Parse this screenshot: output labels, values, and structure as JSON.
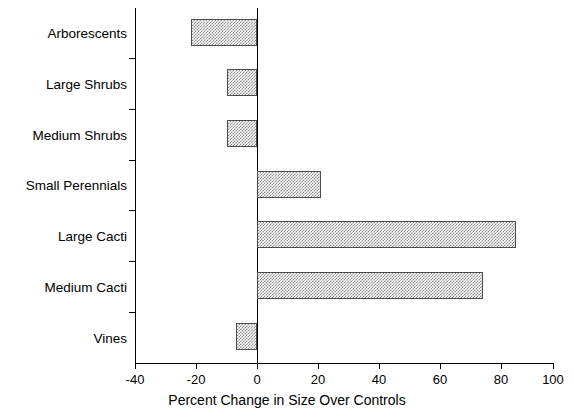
{
  "chart_data": {
    "type": "bar",
    "orientation": "horizontal",
    "title": "",
    "xlabel": "Percent Change in Size Over Controls",
    "ylabel": "",
    "xlim": [
      -40,
      100
    ],
    "xticks": [
      -40,
      -20,
      0,
      20,
      40,
      60,
      80,
      100
    ],
    "xtick_labels": [
      "-40",
      "-20",
      "0",
      "20",
      "40",
      "60",
      "80",
      "100"
    ],
    "grid": false,
    "legend": null,
    "zero_reference_line": 0,
    "categories": [
      "Arborescents",
      "Large Shrubs",
      "Medium Shrubs",
      "Small Perennials",
      "Large Cacti",
      "Medium Cacti",
      "Vines"
    ],
    "values": [
      -21.5,
      -10.0,
      -10.0,
      21.0,
      85.0,
      74.0,
      -7.0
    ],
    "series": [
      {
        "name": "Percent Change in Size Over Controls",
        "values": [
          -21.5,
          -10.0,
          -10.0,
          21.0,
          85.0,
          74.0,
          -7.0
        ]
      }
    ],
    "bar_fill": "hatched-gray-checkerboard",
    "bar_edge_color": "#4a4a4a",
    "bar_fill_color": "#8c8c8c"
  }
}
